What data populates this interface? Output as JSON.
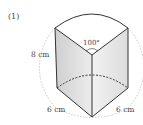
{
  "problem": {
    "number_label": "(1)"
  },
  "figure": {
    "type": "sector prism (cylinder piece)",
    "height_label": "8 cm",
    "angle_label": "100°",
    "radius_left_label": "6 cm",
    "radius_right_label": "6 cm",
    "colors": {
      "edge": "#333333",
      "face_left": "#d9d9d9",
      "face_right": "#eeeeee",
      "top": "#ffffff",
      "guide": "#aaaaaa"
    }
  }
}
